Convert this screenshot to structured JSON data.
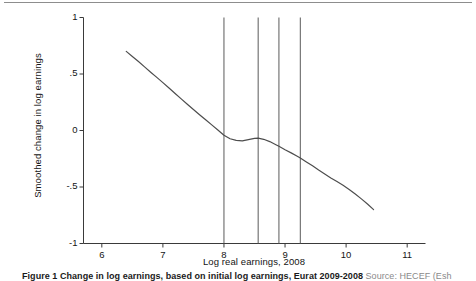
{
  "page": {
    "rule_color": "#8d8d8d",
    "background": "#ffffff"
  },
  "caption": {
    "bold_text": "Figure 1 Change in log earnings, based on initial log earnings, Eurat 2009-2008",
    "source_text": "Source: HECEF (Esh"
  },
  "chart_data": {
    "type": "line",
    "title": "",
    "xlabel": "Log real earnings, 2008",
    "ylabel": "Smoothed change in log earnings",
    "xlim": [
      5.7,
      11.3
    ],
    "ylim": [
      -1,
      1
    ],
    "xticks": [
      6,
      7,
      8,
      9,
      10,
      11
    ],
    "xtick_labels": [
      "6",
      "7",
      "8",
      "9",
      "10",
      "11"
    ],
    "yticks": [
      1,
      0.5,
      0,
      -0.5,
      -1
    ],
    "ytick_labels": [
      "1",
      ".5",
      "0",
      "-.5",
      "-1"
    ],
    "grid": false,
    "legend": false,
    "line_color": "#4d4d4d",
    "vline_color": "#5a5a5a",
    "vlines": [
      8.0,
      8.56,
      8.9,
      9.25
    ],
    "series": [
      {
        "name": "Smoothed change in log earnings",
        "x": [
          6.4,
          6.5,
          6.6,
          6.7,
          6.8,
          6.9,
          7.0,
          7.1,
          7.2,
          7.3,
          7.4,
          7.5,
          7.6,
          7.7,
          7.8,
          7.9,
          8.0,
          8.1,
          8.2,
          8.3,
          8.4,
          8.5,
          8.56,
          8.65,
          8.75,
          8.85,
          8.9,
          9.0,
          9.1,
          9.2,
          9.25,
          9.35,
          9.45,
          9.55,
          9.65,
          9.75,
          9.85,
          9.95,
          10.05,
          10.15,
          10.25,
          10.35,
          10.45
        ],
        "y": [
          0.7,
          0.655,
          0.61,
          0.563,
          0.516,
          0.47,
          0.424,
          0.376,
          0.328,
          0.28,
          0.232,
          0.186,
          0.14,
          0.095,
          0.05,
          0.005,
          -0.042,
          -0.073,
          -0.088,
          -0.092,
          -0.08,
          -0.07,
          -0.068,
          -0.078,
          -0.098,
          -0.126,
          -0.14,
          -0.17,
          -0.198,
          -0.228,
          -0.243,
          -0.278,
          -0.313,
          -0.35,
          -0.385,
          -0.42,
          -0.452,
          -0.485,
          -0.522,
          -0.562,
          -0.605,
          -0.65,
          -0.7
        ]
      }
    ]
  }
}
